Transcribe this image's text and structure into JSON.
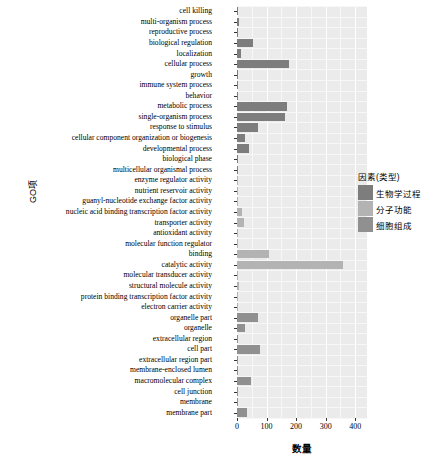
{
  "chart_data": {
    "type": "bar",
    "orientation": "horizontal",
    "title": "",
    "xlabel": "数量",
    "ylabel": "GO项",
    "xlim": [
      0,
      440
    ],
    "xticks": [
      0,
      100,
      200,
      300,
      400
    ],
    "xticklabels": [
      "0",
      "100",
      "200",
      "300",
      "400"
    ],
    "grid": true,
    "legend_position": "right",
    "legend_title": "因素(类型)",
    "series": [
      {
        "name": "生物学过程",
        "color": "#7d7d7d"
      },
      {
        "name": "分子功能",
        "color": "#b3b3b3"
      },
      {
        "name": "细胞组成",
        "color": "#909090"
      }
    ],
    "categories": [
      "cell killing",
      "multi-organism process",
      "reproductive process",
      "biological regulation",
      "localization",
      "cellular process",
      "growth",
      "immune system process",
      "behavior",
      "metabolic process",
      "single-organism process",
      "response to stimulus",
      "cellular component organization or biogenesis",
      "developmental process",
      "biological phase",
      "multicellular organismal process",
      "enzyme regulator activity",
      "nutrient reservoir activity",
      "guanyl-nucleotide exchange factor activity",
      "nucleic acid binding transcription factor activity",
      "transporter activity",
      "antioxidant activity",
      "molecular function regulator",
      "binding",
      "catalytic activity",
      "molecular transducer activity",
      "structural molecule activity",
      "protein binding transcription factor activity",
      "electron carrier activity",
      "organelle part",
      "organelle",
      "extracellular region",
      "cell part",
      "extracellular region part",
      "membrane-enclosed lumen",
      "macromolecular complex",
      "cell junction",
      "membrane",
      "membrane part"
    ],
    "values": [
      1,
      6,
      2,
      55,
      13,
      175,
      2,
      3,
      1,
      170,
      163,
      72,
      26,
      42,
      1,
      2,
      4,
      1,
      1,
      18,
      25,
      1,
      2,
      107,
      358,
      2,
      7,
      1,
      2,
      70,
      28,
      2,
      78,
      2,
      3,
      48,
      2,
      4,
      35
    ],
    "group": [
      "生物学过程",
      "生物学过程",
      "生物学过程",
      "生物学过程",
      "生物学过程",
      "生物学过程",
      "生物学过程",
      "生物学过程",
      "生物学过程",
      "生物学过程",
      "生物学过程",
      "生物学过程",
      "生物学过程",
      "生物学过程",
      "生物学过程",
      "生物学过程",
      "分子功能",
      "分子功能",
      "分子功能",
      "分子功能",
      "分子功能",
      "分子功能",
      "分子功能",
      "分子功能",
      "分子功能",
      "分子功能",
      "分子功能",
      "分子功能",
      "分子功能",
      "细胞组成",
      "细胞组成",
      "细胞组成",
      "细胞组成",
      "细胞组成",
      "细胞组成",
      "细胞组成",
      "细胞组成",
      "细胞组成",
      "细胞组成"
    ]
  },
  "axes": {
    "x_title": "数量",
    "y_title": "GO项"
  },
  "legend": {
    "title": "因素(类型)",
    "items": [
      {
        "label": "生物学过程",
        "color": "#7d7d7d"
      },
      {
        "label": "分子功能",
        "color": "#b3b3b3"
      },
      {
        "label": "细胞组成",
        "color": "#909090"
      }
    ]
  },
  "style": {
    "panel_bg": "#ebebeb",
    "grid_major": "#ffffff",
    "grid_minor": "#f7f7f7"
  }
}
